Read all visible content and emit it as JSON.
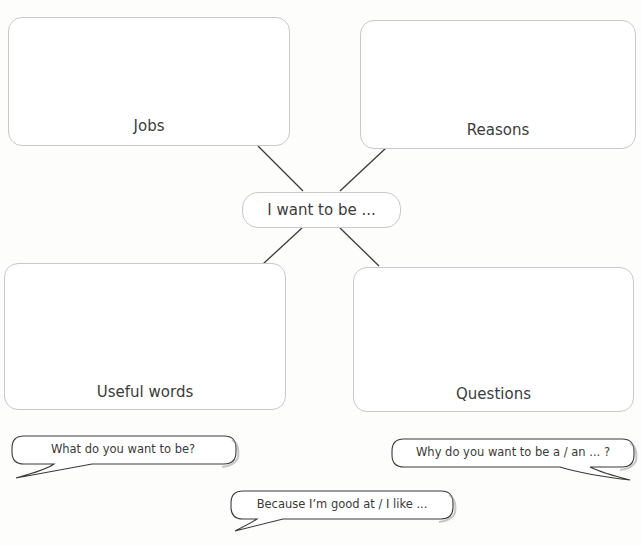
{
  "diagram": {
    "center": {
      "label": "I want to be ..."
    },
    "boxes": {
      "jobs": {
        "label": "Jobs"
      },
      "reasons": {
        "label": "Reasons"
      },
      "useful_words": {
        "label": "Useful words"
      },
      "questions": {
        "label": "Questions"
      }
    },
    "connectors": [
      {
        "from": "jobs",
        "to": "center"
      },
      {
        "from": "reasons",
        "to": "center"
      },
      {
        "from": "useful_words",
        "to": "center"
      },
      {
        "from": "questions",
        "to": "center"
      }
    ]
  },
  "speech_bubbles": [
    {
      "text": "What do you want to be?"
    },
    {
      "text": "Why do you want to be a / an ... ?"
    },
    {
      "text": "Because I’m good at / I like ..."
    }
  ],
  "colors": {
    "box_border": "#c9c9c9",
    "line": "#3a3a3a",
    "text": "#3c3c3c"
  }
}
